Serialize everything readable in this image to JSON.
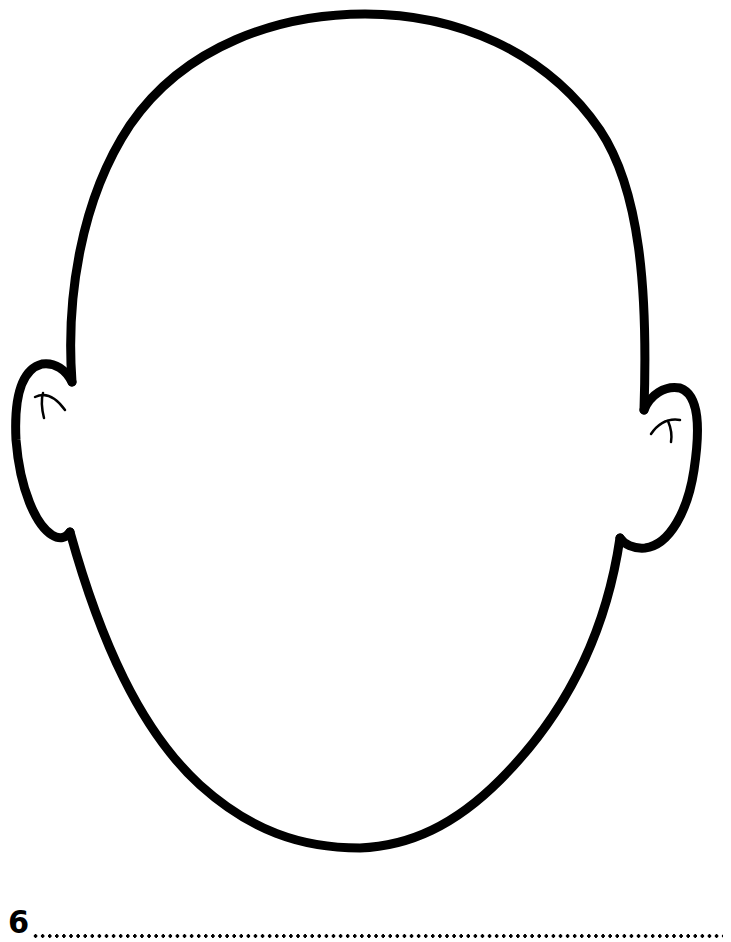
{
  "worksheet": {
    "number": "6",
    "illustration": "blank-face-outline",
    "answer_line": "dotted"
  },
  "colors": {
    "ink": "#000000",
    "paper": "#ffffff"
  }
}
